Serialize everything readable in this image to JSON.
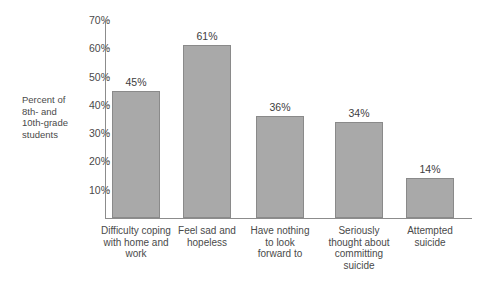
{
  "chart_data": {
    "type": "bar",
    "title": "",
    "xlabel": "",
    "ylabel": "Percent of\n8th- and\n10th-grade\nstudents",
    "ylim": [
      0,
      70
    ],
    "grid": false,
    "legend": null,
    "categories": [
      "Difficulty coping\nwith home and\nwork",
      "Feel sad and\nhopeless",
      "Have nothing\nto look\nforward to",
      "Seriously\nthought about\ncommitting\nsuicide",
      "Attempted\nsuicide"
    ],
    "values": [
      45,
      61,
      36,
      34,
      14
    ],
    "value_labels": [
      "45%",
      "61%",
      "36%",
      "34%",
      "14%"
    ],
    "y_ticks": [
      10,
      20,
      30,
      40,
      50,
      60,
      70
    ],
    "y_tick_labels": [
      "10%",
      "20%",
      "30%",
      "40%",
      "50%",
      "60%",
      "70%"
    ],
    "bar_color": "#a9a9a9",
    "bar_border_color": "#8a8a8a",
    "axis_color": "#8c8c8c",
    "background": "#ffffff"
  }
}
